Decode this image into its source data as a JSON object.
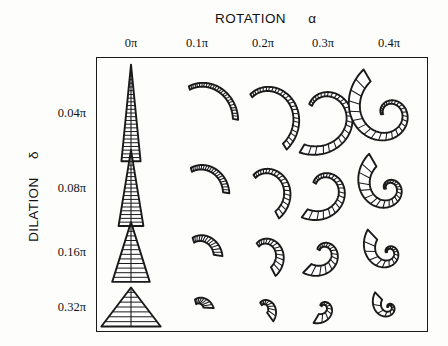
{
  "figure": {
    "x_axis_title": "ROTATION",
    "x_axis_symbol": "α",
    "y_axis_title": "DILATION",
    "y_axis_symbol": "δ",
    "frame_color": "#1a1a1a",
    "ink_color": "#1a1a1a",
    "background": "#fdfdfc"
  },
  "chart_data": {
    "type": "table",
    "xlabel": "ROTATION α",
    "ylabel": "DILATION δ",
    "categories": [
      "0π",
      "0.1π",
      "0.2π",
      "0.3π",
      "0.4π"
    ],
    "row_categories": [
      "0.04π",
      "0.08π",
      "0.16π",
      "0.32π"
    ],
    "legend": [],
    "grid": false,
    "cells": [
      {
        "row": "0.04π",
        "col": "0π",
        "form": "narrow straight cone",
        "coil_turns": 0.0,
        "aspect": 0.22,
        "ribs": 26
      },
      {
        "row": "0.04π",
        "col": "0.1π",
        "form": "slender curved horn",
        "coil_turns": 0.18,
        "aspect": 0.3,
        "ribs": 26
      },
      {
        "row": "0.04π",
        "col": "0.2π",
        "form": "hooked horn",
        "coil_turns": 0.36,
        "aspect": 0.38,
        "ribs": 26
      },
      {
        "row": "0.04π",
        "col": "0.3π",
        "form": "crozier hook",
        "coil_turns": 0.6,
        "aspect": 0.5,
        "ribs": 26
      },
      {
        "row": "0.04π",
        "col": "0.4π",
        "form": "tight inrolled spiral",
        "coil_turns": 1.05,
        "aspect": 0.72,
        "ribs": 30
      },
      {
        "row": "0.08π",
        "col": "0π",
        "form": "straight cone",
        "coil_turns": 0.0,
        "aspect": 0.4,
        "ribs": 20
      },
      {
        "row": "0.08π",
        "col": "0.1π",
        "form": "curved cone",
        "coil_turns": 0.18,
        "aspect": 0.48,
        "ribs": 20
      },
      {
        "row": "0.08π",
        "col": "0.2π",
        "form": "broad hook",
        "coil_turns": 0.38,
        "aspect": 0.58,
        "ribs": 20
      },
      {
        "row": "0.08π",
        "col": "0.3π",
        "form": "curled hook",
        "coil_turns": 0.62,
        "aspect": 0.72,
        "ribs": 22
      },
      {
        "row": "0.08π",
        "col": "0.4π",
        "form": "fan spiral",
        "coil_turns": 1.05,
        "aspect": 1.05,
        "ribs": 26
      },
      {
        "row": "0.16π",
        "col": "0π",
        "form": "wide triangle",
        "coil_turns": 0.0,
        "aspect": 0.85,
        "ribs": 13
      },
      {
        "row": "0.16π",
        "col": "0.1π",
        "form": "skewed triangle",
        "coil_turns": 0.18,
        "aspect": 0.95,
        "ribs": 13
      },
      {
        "row": "0.16π",
        "col": "0.2π",
        "form": "curved wedge",
        "coil_turns": 0.38,
        "aspect": 1.05,
        "ribs": 14
      },
      {
        "row": "0.16π",
        "col": "0.3π",
        "form": "broad fan",
        "coil_turns": 0.65,
        "aspect": 1.25,
        "ribs": 16
      },
      {
        "row": "0.16π",
        "col": "0.4π",
        "form": "open fan spiral",
        "coil_turns": 1.0,
        "aspect": 1.35,
        "ribs": 18
      },
      {
        "row": "0.32π",
        "col": "0π",
        "form": "flat wide triangle",
        "coil_turns": 0.0,
        "aspect": 2.2,
        "ribs": 8
      },
      {
        "row": "0.32π",
        "col": "0.1π",
        "form": "flat skewed triangle",
        "coil_turns": 0.16,
        "aspect": 2.2,
        "ribs": 8
      },
      {
        "row": "0.32π",
        "col": "0.2π",
        "form": "flat swept wedge",
        "coil_turns": 0.35,
        "aspect": 2.1,
        "ribs": 9
      },
      {
        "row": "0.32π",
        "col": "0.3π",
        "form": "flat open fan",
        "coil_turns": 0.6,
        "aspect": 1.9,
        "ribs": 10
      },
      {
        "row": "0.32π",
        "col": "0.4π",
        "form": "open star whorl",
        "coil_turns": 1.0,
        "aspect": 1.6,
        "ribs": 11
      }
    ]
  },
  "columns": [
    {
      "label": "0π",
      "center_x": 131
    },
    {
      "label": "0.1π",
      "center_x": 197
    },
    {
      "label": "0.2π",
      "center_x": 263
    },
    {
      "label": "0.3π",
      "center_x": 323
    },
    {
      "label": "0.4π",
      "center_x": 389
    }
  ],
  "rows": [
    {
      "label": "0.04π",
      "center_y": 113
    },
    {
      "label": "0.08π",
      "center_y": 188
    },
    {
      "label": "0.16π",
      "center_y": 252
    },
    {
      "label": "0.32π",
      "center_y": 307
    }
  ]
}
